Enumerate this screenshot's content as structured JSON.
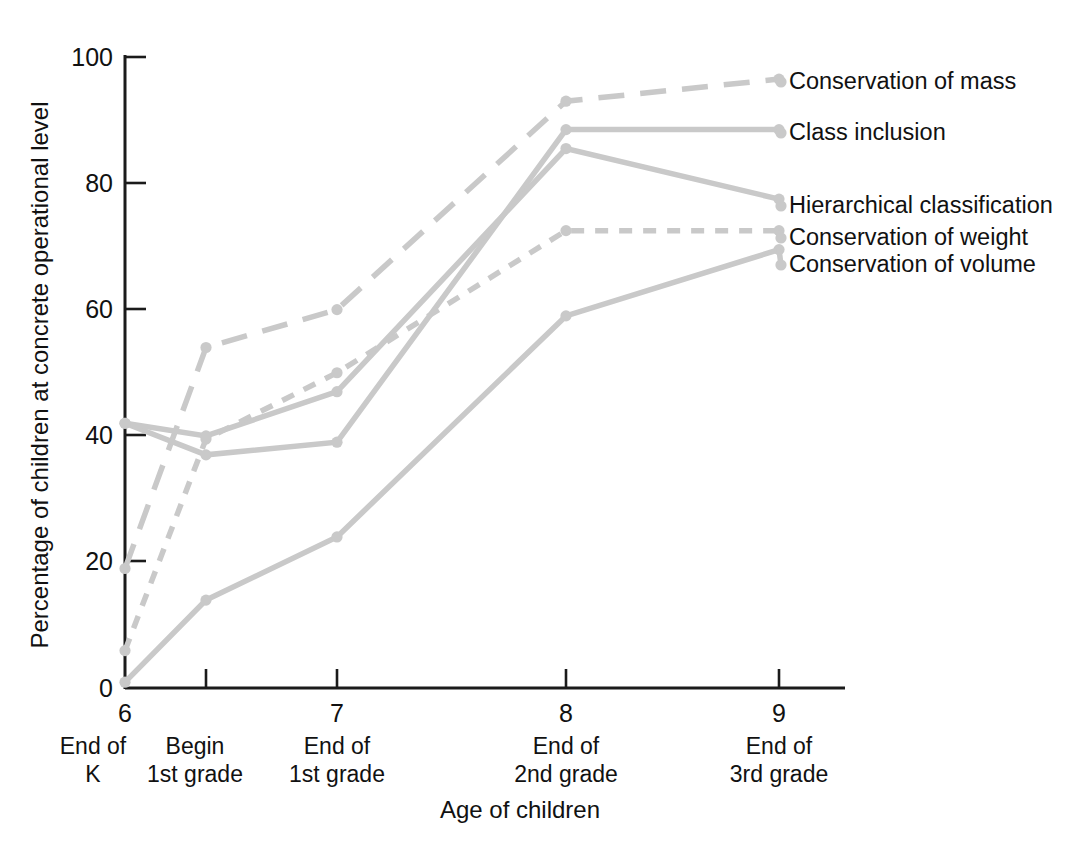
{
  "chart_data": {
    "type": "line",
    "title": "",
    "xlabel": "Age of children",
    "ylabel": "Percentage of children at concrete operational level",
    "x": [
      6,
      6.35,
      7,
      8,
      9
    ],
    "xlim": [
      6,
      9.3
    ],
    "ylim": [
      0,
      100
    ],
    "grid": false,
    "legend_position": "right-inline-labels",
    "y_ticks": [
      "0",
      "20",
      "40",
      "60",
      "80",
      "100"
    ],
    "y_tick_values": [
      0,
      20,
      40,
      60,
      80,
      100
    ],
    "x_ticks": [
      "6",
      "7",
      "8",
      "9"
    ],
    "x_tick_values": [
      6,
      7,
      8,
      9
    ],
    "x_categories": [
      {
        "number": "6",
        "line1": "End of",
        "line2": "K"
      },
      {
        "number": "",
        "line1": "Begin",
        "line2": "1st grade"
      },
      {
        "number": "7",
        "line1": "End of",
        "line2": "1st grade"
      },
      {
        "number": "8",
        "line1": "End of",
        "line2": "2nd grade"
      },
      {
        "number": "9",
        "line1": "End of",
        "line2": "3rd grade"
      }
    ],
    "series": [
      {
        "name": "Conservation of mass",
        "style": "long-dashed",
        "color": "#c9c9c9",
        "values": [
          19,
          54,
          60,
          93,
          96.5
        ]
      },
      {
        "name": "Class inclusion",
        "style": "solid",
        "color": "#c9c9c9",
        "values": [
          42,
          37,
          39,
          88.5,
          88.5
        ]
      },
      {
        "name": "Hierarchical classification",
        "style": "solid",
        "color": "#c9c9c9",
        "values": [
          42,
          40,
          47,
          85.5,
          77.5
        ]
      },
      {
        "name": "Conservation of weight",
        "style": "short-dashed",
        "color": "#c9c9c9",
        "values": [
          6,
          39.5,
          50,
          72.5,
          72.5
        ]
      },
      {
        "name": "Conservation of volume",
        "style": "solid",
        "color": "#c9c9c9",
        "values": [
          1,
          14,
          24,
          59,
          69.5
        ]
      }
    ]
  },
  "legend": [
    {
      "label": "Conservation of mass",
      "y": 82
    },
    {
      "label": "Class inclusion",
      "y": 133
    },
    {
      "label": "Hierarchical classification",
      "y": 206
    },
    {
      "label": "Conservation of weight",
      "y": 238
    },
    {
      "label": "Conservation of volume",
      "y": 265
    }
  ],
  "colors": {
    "series_gray": "#c9c9c9",
    "axis_black": "#1b1b1b",
    "background": "#ffffff",
    "text": "#111111"
  }
}
